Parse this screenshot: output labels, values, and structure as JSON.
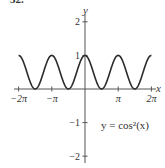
{
  "problem_number": "32.",
  "chart_data": {
    "type": "line",
    "title": "",
    "equation_label": "y = cos²(x)",
    "xlabel": "x",
    "ylabel": "y",
    "xlim": [
      -6.2832,
      6.2832
    ],
    "ylim": [
      -2,
      2
    ],
    "grid": false,
    "x_ticks": [
      {
        "value": -6.2832,
        "label": "−2π"
      },
      {
        "value": -3.1416,
        "label": "−π"
      },
      {
        "value": 3.1416,
        "label": "π"
      },
      {
        "value": 6.2832,
        "label": "2π"
      }
    ],
    "y_ticks": [
      {
        "value": 2,
        "label": "2"
      },
      {
        "value": 1,
        "label": "1"
      },
      {
        "value": -1,
        "label": "−1"
      },
      {
        "value": -2,
        "label": "−2"
      }
    ],
    "series": [
      {
        "name": "y = cos²(x)",
        "function": "cos(x)^2",
        "x": [
          -6.2832,
          -4.7124,
          -3.1416,
          -1.5708,
          0,
          1.5708,
          3.1416,
          4.7124,
          6.2832
        ],
        "values": [
          1,
          0,
          1,
          0,
          1,
          0,
          1,
          0,
          1
        ]
      }
    ],
    "colors": {
      "curve": "#2b2b2b",
      "axes": "#555555"
    }
  }
}
